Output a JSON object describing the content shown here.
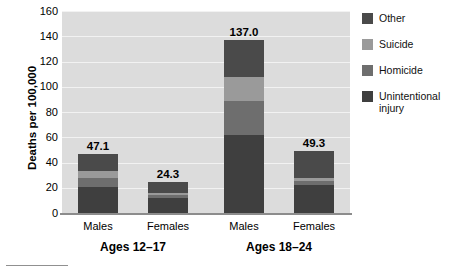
{
  "chart_data": {
    "type": "bar",
    "subtype": "stacked-bar",
    "title": "",
    "xlabel": "",
    "ylabel": "Deaths per 100,000",
    "ylim": [
      0,
      160
    ],
    "yticks": [
      160,
      140,
      120,
      100,
      80,
      60,
      40,
      20,
      0
    ],
    "grid": true,
    "legend_position": "right",
    "categories": [
      "Males",
      "Females",
      "Males",
      "Females"
    ],
    "groups": [
      {
        "label": "Ages 12–17",
        "categories": [
          "Males",
          "Females"
        ]
      },
      {
        "label": "Ages 18–24",
        "categories": [
          "Males",
          "Females"
        ]
      }
    ],
    "series": [
      {
        "name": "Unintentional injury",
        "color": "#3f3f3f",
        "values": [
          21.0,
          12.0,
          62.0,
          22.0
        ]
      },
      {
        "name": "Homicide",
        "color": "#6e6e6e",
        "values": [
          7.0,
          2.0,
          27.0,
          3.0
        ]
      },
      {
        "name": "Suicide",
        "color": "#9a9a9a",
        "values": [
          5.0,
          2.0,
          19.0,
          3.0
        ]
      },
      {
        "name": "Other",
        "color": "#4a4a4a",
        "values": [
          14.1,
          8.3,
          29.0,
          21.3
        ]
      }
    ],
    "totals": [
      47.1,
      24.3,
      137.0,
      49.3
    ],
    "total_labels": [
      "47.1",
      "24.3",
      "137.0",
      "49.3"
    ],
    "plot_background": "#dcdcdc",
    "gridline_color": "#f2f2f2",
    "axis_color": "#8c8c8c"
  },
  "legend": {
    "items": [
      {
        "label": "Other",
        "color": "#4a4a4a"
      },
      {
        "label": "Suicide",
        "color": "#9a9a9a"
      },
      {
        "label": "Homicide",
        "color": "#6e6e6e"
      },
      {
        "label": "Unintentional injury",
        "color": "#3f3f3f"
      }
    ]
  }
}
